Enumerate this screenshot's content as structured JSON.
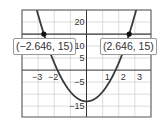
{
  "chart_data": {
    "type": "line",
    "title": "",
    "xlabel": "",
    "ylabel": "",
    "xlim": [
      -4,
      4
    ],
    "ylim": [
      -19.5,
      25
    ],
    "grid": true,
    "x_ticks": [
      {
        "value": -3,
        "label": "−3"
      },
      {
        "value": -2,
        "label": "−2"
      },
      {
        "value": 1,
        "label": "1"
      },
      {
        "value": 2,
        "label": "2"
      },
      {
        "value": 3,
        "label": "3"
      }
    ],
    "y_ticks": [
      {
        "value": 20,
        "label": "20"
      },
      {
        "value": 10,
        "label": "10"
      },
      {
        "value": 5,
        "label": "5"
      },
      {
        "value": -5,
        "label": "−5"
      },
      {
        "value": -15,
        "label": "−15"
      }
    ],
    "x_grid_step": 1,
    "y_grid_step": 5,
    "series": [
      {
        "name": "parabola",
        "function": "4x^2 - 13",
        "color": "#3a3a3a"
      },
      {
        "name": "horizontal-line",
        "function": "y = 15",
        "color": "#3a3a3a"
      }
    ],
    "points": [
      {
        "x": -2.646,
        "y": 15,
        "label": "(−2.646, 15)"
      },
      {
        "x": 2.646,
        "y": 15,
        "label": "(2.646, 15)"
      }
    ]
  },
  "colors": {
    "grid": "#d4d4d4",
    "axis": "#333333",
    "frame": "#555555",
    "curve": "#3a3a3a"
  }
}
